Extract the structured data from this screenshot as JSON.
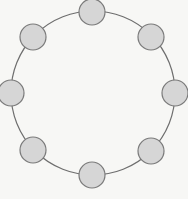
{
  "diagram": {
    "type": "ring-topology",
    "background": "#f7f7f5",
    "ring": {
      "cx": 93,
      "cy": 93,
      "r": 82,
      "stroke": "#6e6e6e",
      "stroke_width": 1.2
    },
    "node_style": {
      "r": 13,
      "fill": "#d6d6d6",
      "stroke": "#7a7a7a",
      "stroke_width": 1.2
    },
    "nodes": [
      {
        "id": "node-top",
        "cx": 92,
        "cy": 12
      },
      {
        "id": "node-top-right",
        "cx": 151,
        "cy": 37
      },
      {
        "id": "node-right",
        "cx": 175,
        "cy": 93
      },
      {
        "id": "node-bottom-right",
        "cx": 151,
        "cy": 151
      },
      {
        "id": "node-bottom",
        "cx": 92,
        "cy": 175
      },
      {
        "id": "node-bottom-left",
        "cx": 33,
        "cy": 150
      },
      {
        "id": "node-left",
        "cx": 11,
        "cy": 93
      },
      {
        "id": "node-top-left",
        "cx": 33,
        "cy": 37
      }
    ]
  }
}
